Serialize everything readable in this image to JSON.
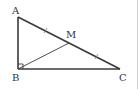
{
  "diagram": {
    "type": "geometry",
    "colors": {
      "stroke": "#3a3a3a",
      "label": "#333333",
      "background": "#ffffff",
      "border": "#d0d0d0"
    },
    "points": {
      "A": {
        "label": "A",
        "x": 18,
        "y": 17
      },
      "B": {
        "label": "B",
        "x": 18,
        "y": 69
      },
      "C": {
        "label": "C",
        "x": 120,
        "y": 69
      },
      "M": {
        "label": "M",
        "x": 69,
        "y": 43
      }
    },
    "segments": [
      {
        "from": "A",
        "to": "B"
      },
      {
        "from": "B",
        "to": "C"
      },
      {
        "from": "A",
        "to": "C"
      },
      {
        "from": "B",
        "to": "M"
      }
    ],
    "marks": {
      "right_angle": "B",
      "equal_ticks": [
        "AM",
        "MC"
      ]
    }
  }
}
